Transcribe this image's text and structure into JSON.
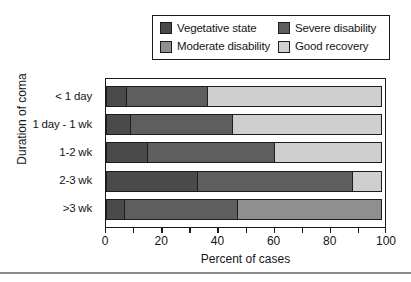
{
  "chart_data": {
    "type": "bar",
    "orientation": "horizontal",
    "stacked": true,
    "normalized": "100%",
    "title": "",
    "xlabel": "Percent of cases",
    "ylabel": "Duration of coma",
    "xlim": [
      0,
      100
    ],
    "xticks": [
      0,
      10,
      20,
      30,
      40,
      50,
      60,
      70,
      80,
      90,
      100
    ],
    "xtick_labels": [
      "0",
      "20",
      "40",
      "60",
      "80",
      "100"
    ],
    "xtick_label_values": [
      0,
      20,
      40,
      60,
      80,
      100
    ],
    "grid": false,
    "legend_position": "top-center",
    "categories": [
      "< 1 day",
      "1 day - 1 wk",
      "1-2 wk",
      "2-3 wk",
      ">3 wk"
    ],
    "series": [
      {
        "name": "Vegetative state",
        "color": "#4a4a4a",
        "values": [
          7.5,
          9,
          15,
          33,
          7
        ]
      },
      {
        "name": "Severe disability",
        "color": "#5e5e5e",
        "values": [
          29.5,
          37,
          46,
          56,
          41
        ]
      },
      {
        "name": "Moderate disability",
        "color": "#8f8f8f",
        "values": [
          0,
          0,
          0,
          0,
          52
        ]
      },
      {
        "name": "Good recovery",
        "color": "#cfcfcf",
        "values": [
          63,
          54,
          39,
          11,
          0
        ]
      }
    ]
  },
  "legend": {
    "items": [
      {
        "label": "Vegetative state",
        "color": "#4a4a4a"
      },
      {
        "label": "Severe disability",
        "color": "#5e5e5e"
      },
      {
        "label": "Moderate disability",
        "color": "#8f8f8f"
      },
      {
        "label": "Good recovery",
        "color": "#cfcfcf"
      }
    ]
  },
  "axes": {
    "y_title": "Duration of coma",
    "x_title": "Percent of cases",
    "y_categories": [
      "< 1 day",
      "1 day - 1 wk",
      "1-2 wk",
      "2-3 wk",
      ">3 wk"
    ],
    "x_labels": [
      "0",
      "20",
      "40",
      "60",
      "80",
      "100"
    ]
  }
}
